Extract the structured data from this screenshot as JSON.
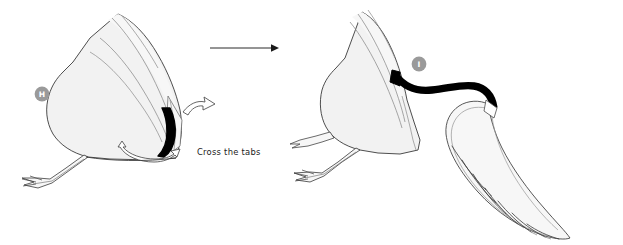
{
  "diagram": {
    "background_color": "#ffffff",
    "paper_fill": "#f2f2f2",
    "paper_fill_light": "#f7f7f7",
    "outline_color": "#3a3a3a",
    "crease_color": "#8a8a8a",
    "solid_black": "#000000",
    "label_badge_color": "#9a9a9a",
    "label_text_color": "#ffffff"
  },
  "steps": [
    {
      "id": "step-h",
      "label": "H",
      "caption": "Cross the tabs",
      "arrows": [
        {
          "name": "crossing-tabs-arrow",
          "style": "hollow-curved"
        },
        {
          "name": "spread-arrow",
          "style": "hollow-double-headed-curved"
        }
      ]
    },
    {
      "id": "step-i",
      "label": "I",
      "caption": "",
      "arrows": []
    }
  ],
  "transition": {
    "name": "step-transition-arrow",
    "direction": "right",
    "color": "#2b2b2b"
  }
}
